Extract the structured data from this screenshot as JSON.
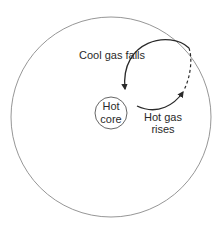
{
  "diagram": {
    "labels": {
      "core_line1": "Hot",
      "core_line2": "core",
      "falls": "Cool gas falls",
      "rises_line1": "Hot gas",
      "rises_line2": "rises"
    },
    "colors": {
      "stroke": "#2a2a2a",
      "outer": "#8a8a8a"
    }
  }
}
